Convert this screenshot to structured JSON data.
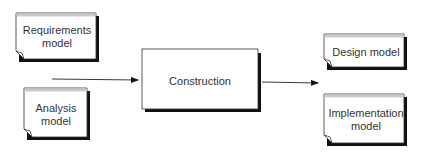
{
  "diagram": {
    "inputs": [
      {
        "id": "requirements",
        "lines": [
          "Requirements",
          "model"
        ]
      },
      {
        "id": "analysis",
        "lines": [
          "Analysis",
          "model"
        ]
      }
    ],
    "process": {
      "label": "Construction"
    },
    "outputs": [
      {
        "id": "design",
        "lines": [
          "Design model"
        ]
      },
      {
        "id": "implementation",
        "lines": [
          "Implementation",
          "model"
        ]
      }
    ],
    "edges": [
      {
        "from": "inputs",
        "to": "Construction"
      },
      {
        "from": "Construction",
        "to": "outputs"
      }
    ]
  }
}
